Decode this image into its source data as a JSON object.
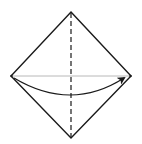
{
  "diagram": {
    "type": "origami-fold-step",
    "colors": {
      "background": "#ffffff",
      "outline": "#1a1a1a",
      "fold_line": "#1a1a1a",
      "crease_line": "#b8b8b8",
      "arrow": "#1a1a1a"
    },
    "shapes": {
      "diamond": {
        "top": [
          71,
          12
        ],
        "right": [
          131,
          76
        ],
        "bottom": [
          71,
          138
        ],
        "left": [
          11,
          76
        ]
      },
      "crease": {
        "from": [
          13,
          76
        ],
        "to": [
          129,
          76
        ]
      },
      "fold_line": {
        "from": [
          71,
          13
        ],
        "to": [
          71,
          137
        ],
        "style": "dashed"
      },
      "arrow": {
        "from": [
          14,
          78
        ],
        "control": [
          71,
          112
        ],
        "to": [
          124,
          78
        ]
      }
    }
  }
}
